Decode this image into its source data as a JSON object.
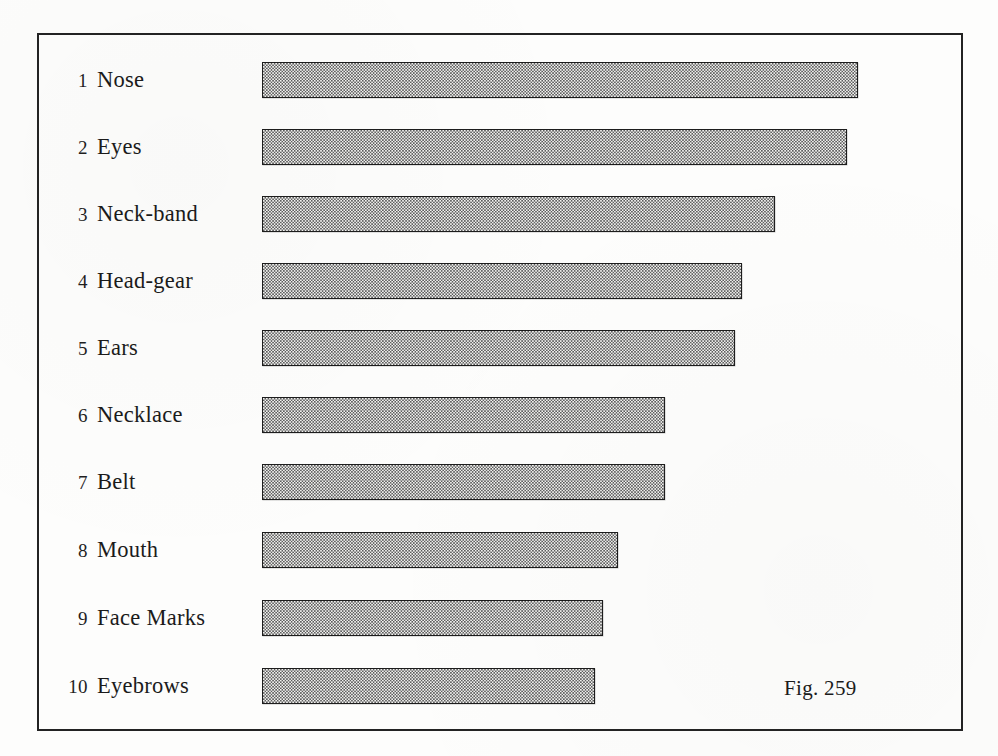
{
  "figure": {
    "caption": "Fig. 259",
    "caption_x": 784,
    "caption_y": 678
  },
  "frame": {
    "border_color": "#232323",
    "x": 37,
    "y": 33,
    "width": 926,
    "height": 698
  },
  "chart_data": {
    "type": "bar",
    "orientation": "horizontal",
    "title": "Fig. 259",
    "xlabel": "",
    "ylabel": "",
    "grid": false,
    "legend": null,
    "axis_visible": false,
    "value_unit": "pixel-length",
    "bar_origin_x": 262,
    "bar_height_px": 36,
    "row_pitch_px": 67,
    "bar_fill_color": "#f2f2f0",
    "bar_pattern": "stipple-dot-screen",
    "bar_border_color": "#1d1d1d",
    "categories": [
      "Nose",
      "Eyes",
      "Neck-band",
      "Head-gear",
      "Ears",
      "Necklace",
      "Belt",
      "Mouth",
      "Face Marks",
      "Eyebrows"
    ],
    "ranks": [
      1,
      2,
      3,
      4,
      5,
      6,
      7,
      8,
      9,
      10
    ],
    "values": [
      596,
      585,
      513,
      480,
      473,
      403,
      403,
      356,
      341,
      333
    ],
    "bar_end_x": [
      858,
      847,
      775,
      742,
      735,
      665,
      665,
      618,
      603,
      595
    ],
    "bar_top_y": [
      62,
      129,
      196,
      263,
      330,
      397,
      464,
      532,
      600,
      668
    ],
    "xlim": [
      0,
      620
    ]
  },
  "rows": [
    {
      "index": "1",
      "label": "Nose"
    },
    {
      "index": "2",
      "label": "Eyes"
    },
    {
      "index": "3",
      "label": "Neck-band"
    },
    {
      "index": "4",
      "label": "Head-gear"
    },
    {
      "index": "5",
      "label": "Ears"
    },
    {
      "index": "6",
      "label": "Necklace"
    },
    {
      "index": "7",
      "label": "Belt"
    },
    {
      "index": "8",
      "label": "Mouth"
    },
    {
      "index": "9",
      "label": "Face Marks"
    },
    {
      "index": "10",
      "label": "Eyebrows"
    }
  ]
}
